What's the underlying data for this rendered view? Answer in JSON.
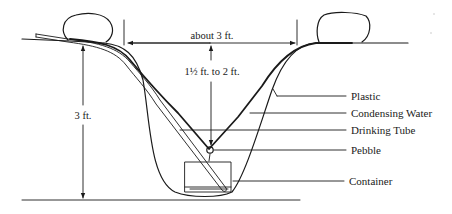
{
  "diagram": {
    "dimensions": {
      "width_label": "about 3 ft.",
      "center_depth_label": "1½ ft. to 2 ft.",
      "total_depth_label": "3 ft."
    },
    "callouts": [
      {
        "id": "plastic",
        "label": "Plastic"
      },
      {
        "id": "condensing-water",
        "label": "Condensing Water"
      },
      {
        "id": "drinking-tube",
        "label": "Drinking Tube"
      },
      {
        "id": "pebble",
        "label": "Pebble"
      },
      {
        "id": "container",
        "label": "Container"
      }
    ],
    "colors": {
      "line": "#1a1a1a",
      "background": "#ffffff"
    }
  }
}
